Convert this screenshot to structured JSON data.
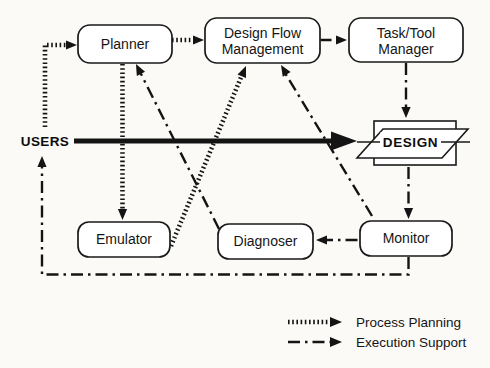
{
  "nodes": {
    "planner": {
      "label": "Planner"
    },
    "design_flow_management": {
      "line1": "Design Flow",
      "line2": "Management"
    },
    "task_tool_manager": {
      "line1": "Task/Tool",
      "line2": "Manager"
    },
    "design": {
      "label": "DESIGN"
    },
    "emulator": {
      "label": "Emulator"
    },
    "diagnoser": {
      "label": "Diagnoser"
    },
    "monitor": {
      "label": "Monitor"
    },
    "users": {
      "label": "USERS"
    }
  },
  "legend": {
    "items": [
      {
        "style": "process-planning",
        "label": "Process Planning"
      },
      {
        "style": "execution-support",
        "label": "Execution Support"
      }
    ]
  },
  "edges": [
    {
      "from": "users",
      "to": "planner",
      "style": "process-planning"
    },
    {
      "from": "planner",
      "to": "design_flow_management",
      "style": "process-planning"
    },
    {
      "from": "planner",
      "to": "emulator",
      "style": "process-planning"
    },
    {
      "from": "emulator",
      "to": "design_flow_management",
      "style": "process-planning"
    },
    {
      "from": "design_flow_management",
      "to": "task_tool_manager",
      "style": "execution-support"
    },
    {
      "from": "task_tool_manager",
      "to": "design",
      "style": "execution-support"
    },
    {
      "from": "users",
      "to": "design",
      "style": "solid"
    },
    {
      "from": "design",
      "to": "monitor",
      "style": "execution-support"
    },
    {
      "from": "monitor",
      "to": "design_flow_management",
      "style": "execution-support"
    },
    {
      "from": "monitor",
      "to": "diagnoser",
      "style": "execution-support"
    },
    {
      "from": "diagnoser",
      "to": "planner",
      "style": "execution-support"
    },
    {
      "from": "monitor",
      "to": "users",
      "style": "execution-support"
    }
  ],
  "colors": {
    "ink": "#141414",
    "paper": "#fbfaf7"
  }
}
